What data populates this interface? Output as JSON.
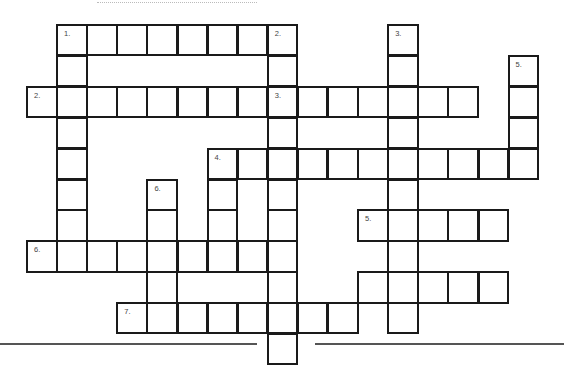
{
  "puzzle": {
    "type": "crossword",
    "grid_origin": {
      "x": 27,
      "y": 25
    },
    "cell_pitch": {
      "x": 30.1,
      "y": 30.9
    },
    "colors": {
      "border": "#1a1a1a",
      "cell": "#ffffff",
      "label": "#444444",
      "rule": "#555555"
    },
    "clue_numbers": {
      "across": [
        {
          "num": "1.",
          "row": 0,
          "col": 1,
          "length": 7
        },
        {
          "num": "2.",
          "row": 2,
          "col": 0,
          "length": 8
        },
        {
          "num": "3.",
          "row": 2,
          "col": 8,
          "length": 7
        },
        {
          "num": "4.",
          "row": 4,
          "col": 6,
          "length": 11
        },
        {
          "num": "5.",
          "row": 6,
          "col": 11,
          "length": 5
        },
        {
          "num": "6.",
          "row": 7,
          "col": 0,
          "length": 9
        },
        {
          "num": "7.",
          "row": 9,
          "col": 3,
          "length": 8
        }
      ],
      "down": [
        {
          "num": "1.",
          "row": 0,
          "col": 1,
          "length": 8
        },
        {
          "num": "2.",
          "row": 0,
          "col": 8,
          "length": 11
        },
        {
          "num": "3.",
          "row": 0,
          "col": 12,
          "length": 10
        },
        {
          "num": "4.",
          "row": 4,
          "col": 6,
          "length": 4
        },
        {
          "num": "5.",
          "row": 1,
          "col": 16,
          "length": 4
        },
        {
          "num": "6.",
          "row": 5,
          "col": 4,
          "length": 5
        }
      ]
    },
    "labels": [
      {
        "text": "1.",
        "row": 0,
        "col": 1
      },
      {
        "text": "2.",
        "row": 0,
        "col": 8
      },
      {
        "text": "3.",
        "row": 0,
        "col": 12
      },
      {
        "text": "5.",
        "row": 1,
        "col": 16
      },
      {
        "text": "2.",
        "row": 2,
        "col": 0
      },
      {
        "text": "3.",
        "row": 2,
        "col": 8
      },
      {
        "text": "4.",
        "row": 4,
        "col": 6
      },
      {
        "text": "6.",
        "row": 5,
        "col": 4
      },
      {
        "text": "5.",
        "row": 6,
        "col": 11
      },
      {
        "text": "6.",
        "row": 7,
        "col": 0
      },
      {
        "text": "7.",
        "row": 9,
        "col": 3
      }
    ],
    "cells": [
      [
        0,
        1
      ],
      [
        0,
        2
      ],
      [
        0,
        3
      ],
      [
        0,
        4
      ],
      [
        0,
        5
      ],
      [
        0,
        6
      ],
      [
        0,
        7
      ],
      [
        0,
        8
      ],
      [
        0,
        12
      ],
      [
        1,
        1
      ],
      [
        1,
        8
      ],
      [
        1,
        12
      ],
      [
        1,
        16
      ],
      [
        2,
        0
      ],
      [
        2,
        1
      ],
      [
        2,
        2
      ],
      [
        2,
        3
      ],
      [
        2,
        4
      ],
      [
        2,
        5
      ],
      [
        2,
        6
      ],
      [
        2,
        7
      ],
      [
        2,
        8
      ],
      [
        2,
        9
      ],
      [
        2,
        10
      ],
      [
        2,
        11
      ],
      [
        2,
        12
      ],
      [
        2,
        13
      ],
      [
        2,
        14
      ],
      [
        2,
        16
      ],
      [
        3,
        1
      ],
      [
        3,
        8
      ],
      [
        3,
        12
      ],
      [
        3,
        16
      ],
      [
        4,
        1
      ],
      [
        4,
        6
      ],
      [
        4,
        7
      ],
      [
        4,
        8
      ],
      [
        4,
        9
      ],
      [
        4,
        10
      ],
      [
        4,
        11
      ],
      [
        4,
        12
      ],
      [
        4,
        13
      ],
      [
        4,
        14
      ],
      [
        4,
        15
      ],
      [
        4,
        16
      ],
      [
        5,
        1
      ],
      [
        5,
        4
      ],
      [
        5,
        6
      ],
      [
        5,
        8
      ],
      [
        5,
        12
      ],
      [
        6,
        1
      ],
      [
        6,
        4
      ],
      [
        6,
        6
      ],
      [
        6,
        8
      ],
      [
        6,
        11
      ],
      [
        6,
        12
      ],
      [
        6,
        13
      ],
      [
        6,
        14
      ],
      [
        6,
        15
      ],
      [
        7,
        0
      ],
      [
        7,
        1
      ],
      [
        7,
        2
      ],
      [
        7,
        3
      ],
      [
        7,
        4
      ],
      [
        7,
        5
      ],
      [
        7,
        6
      ],
      [
        7,
        7
      ],
      [
        7,
        8
      ],
      [
        7,
        12
      ],
      [
        8,
        4
      ],
      [
        8,
        8
      ],
      [
        8,
        11
      ],
      [
        8,
        12
      ],
      [
        8,
        13
      ],
      [
        8,
        14
      ],
      [
        8,
        15
      ],
      [
        9,
        3
      ],
      [
        9,
        4
      ],
      [
        9,
        5
      ],
      [
        9,
        6
      ],
      [
        9,
        7
      ],
      [
        9,
        8
      ],
      [
        9,
        9
      ],
      [
        9,
        10
      ],
      [
        9,
        12
      ],
      [
        10,
        8
      ]
    ],
    "rules": [
      {
        "x1": 0,
        "x2": 257,
        "y": 343
      },
      {
        "x1": 315,
        "x2": 564,
        "y": 343
      }
    ]
  }
}
